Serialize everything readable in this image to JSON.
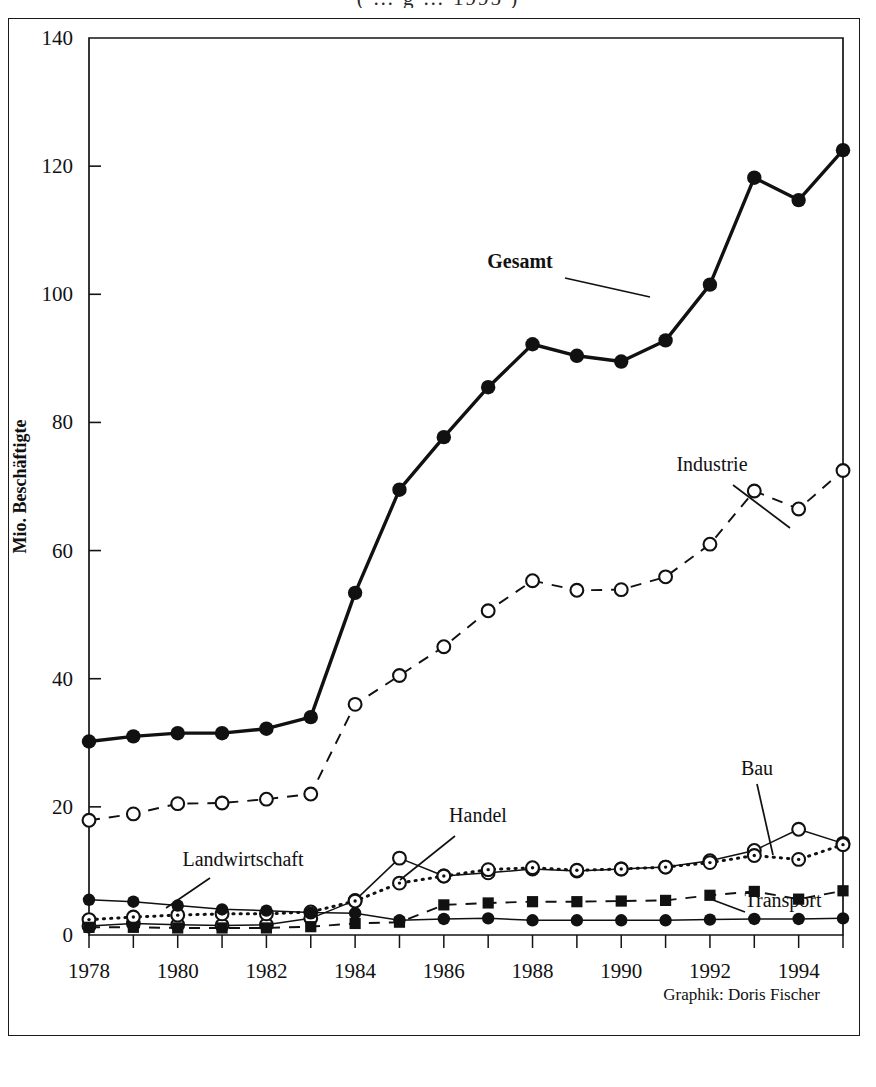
{
  "page": {
    "top_title_fragment": "( … g … 1995 )",
    "credit": "Graphik: Doris Fischer"
  },
  "axes": {
    "y_label": "Mio. Beschäftigte",
    "y_ticks": [
      "0",
      "20",
      "40",
      "60",
      "80",
      "100",
      "120",
      "140"
    ],
    "x_ticks": [
      "1978",
      "1980",
      "1982",
      "1984",
      "1986",
      "1988",
      "1990",
      "1992",
      "1994"
    ]
  },
  "annotations": {
    "gesamt": "Gesamt",
    "industrie": "Industrie",
    "handel": "Handel",
    "landwirtschaft": "Landwirtschaft",
    "bau": "Bau",
    "transport": "Transport"
  },
  "chart_data": {
    "type": "line",
    "title": "",
    "xlabel": "",
    "ylabel": "Mio. Beschäftigte",
    "ylim": [
      0,
      140
    ],
    "xlim": [
      1978,
      1995
    ],
    "ytick_step": 20,
    "grid": false,
    "legend": "inline-annotations",
    "x": [
      1978,
      1979,
      1980,
      1981,
      1982,
      1983,
      1984,
      1985,
      1986,
      1987,
      1988,
      1989,
      1990,
      1991,
      1992,
      1993,
      1994,
      1995
    ],
    "series": [
      {
        "name": "Gesamt",
        "marker": "filled-circle",
        "line": "solid-thick",
        "values": [
          30.2,
          31.0,
          31.5,
          31.5,
          32.2,
          34.0,
          53.4,
          69.5,
          77.7,
          85.5,
          92.2,
          90.4,
          89.5,
          92.8,
          101.5,
          118.2,
          114.7,
          122.5
        ]
      },
      {
        "name": "Industrie",
        "marker": "open-circle",
        "line": "dashed",
        "values": [
          17.9,
          18.9,
          20.5,
          20.6,
          21.2,
          22.0,
          36.0,
          40.5,
          45.0,
          50.6,
          55.3,
          53.8,
          53.9,
          55.9,
          61.0,
          69.3,
          66.5,
          72.5
        ]
      },
      {
        "name": "Bau",
        "marker": "open-circle",
        "line": "solid-thin",
        "values": [
          1.4,
          1.8,
          1.6,
          1.5,
          1.6,
          2.6,
          5.4,
          12.0,
          9.2,
          9.7,
          10.3,
          10.0,
          10.3,
          10.6,
          11.6,
          13.2,
          16.5,
          14.3
        ]
      },
      {
        "name": "Handel",
        "marker": "dotted-circle",
        "line": "dotted",
        "values": [
          2.4,
          2.8,
          3.1,
          3.3,
          3.3,
          3.6,
          5.3,
          8.1,
          9.2,
          10.2,
          10.5,
          10.1,
          10.3,
          10.6,
          11.3,
          12.4,
          11.8,
          14.1
        ]
      },
      {
        "name": "Transport",
        "marker": "filled-square",
        "line": "dashed",
        "values": [
          1.2,
          1.2,
          1.1,
          1.1,
          1.1,
          1.3,
          1.8,
          2.0,
          4.7,
          5.0,
          5.2,
          5.2,
          5.3,
          5.4,
          6.2,
          6.8,
          5.6,
          6.9
        ]
      },
      {
        "name": "Landwirtschaft",
        "marker": "filled-circle",
        "line": "solid-thin",
        "values": [
          5.5,
          5.2,
          4.6,
          4.0,
          3.8,
          3.5,
          3.4,
          2.3,
          2.5,
          2.6,
          2.3,
          2.3,
          2.3,
          2.3,
          2.4,
          2.5,
          2.5,
          2.6
        ]
      }
    ]
  }
}
